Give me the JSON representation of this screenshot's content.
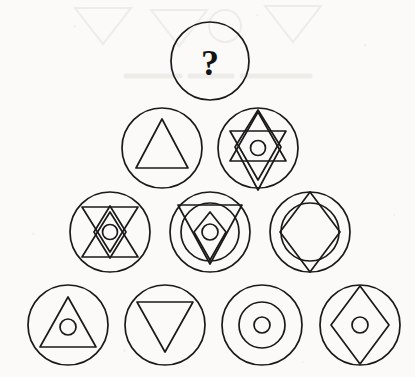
{
  "puzzle": {
    "title": "Shape Pyramid Puzzle",
    "unknown_symbol": "?",
    "stroke_color": "#1a1a1a",
    "background_color": "#fbfaf8",
    "layout": "pyramid",
    "row_counts": [
      1,
      2,
      3,
      4
    ],
    "cell_count": 10
  },
  "cells": [
    {
      "id": "cell-r1-c1",
      "row": 1,
      "col": 1,
      "cx": 210,
      "cy": 61,
      "r": 39,
      "label": "unknown-cell",
      "contents": "question-mark",
      "glyphs": [
        "question-mark"
      ]
    },
    {
      "id": "cell-r2-c1",
      "row": 2,
      "col": 1,
      "cx": 162,
      "cy": 148,
      "r": 40,
      "label": "triangle-up-cell",
      "contents": "upward triangle",
      "glyphs": [
        "triangle-up"
      ]
    },
    {
      "id": "cell-r2-c2",
      "row": 2,
      "col": 2,
      "cx": 258,
      "cy": 148,
      "r": 40,
      "label": "star-diamond-dot-cell",
      "contents": "six-pointed star with tall diamond and small circle",
      "glyphs": [
        "triangle-up",
        "triangle-down",
        "diamond-tall",
        "circle-small"
      ]
    },
    {
      "id": "cell-r3-c1",
      "row": 3,
      "col": 1,
      "cx": 110,
      "cy": 232,
      "r": 40,
      "label": "bowtie-diamond-dot-cell",
      "contents": "hourglass bowtie of two triangles with diamond and small circle",
      "glyphs": [
        "triangle-down",
        "triangle-up",
        "diamond-tall",
        "circle-small"
      ]
    },
    {
      "id": "cell-r3-c2",
      "row": 3,
      "col": 2,
      "cx": 210,
      "cy": 232,
      "r": 40,
      "label": "triangle-down-circle-diamond-dot-cell",
      "contents": "downward triangle over inner circle with diamond and small circle",
      "glyphs": [
        "triangle-down",
        "circle-inner",
        "diamond-tall",
        "circle-small"
      ]
    },
    {
      "id": "cell-r3-c3",
      "row": 3,
      "col": 3,
      "cx": 310,
      "cy": 232,
      "r": 40,
      "label": "diamond-over-circle-cell",
      "contents": "tall diamond overlapping inner circle forming octagon",
      "glyphs": [
        "circle-inner",
        "diamond-tall"
      ]
    },
    {
      "id": "cell-r4-c1",
      "row": 4,
      "col": 1,
      "cx": 68,
      "cy": 325,
      "r": 40,
      "label": "triangle-up-dot-cell",
      "contents": "upward triangle containing a small circle",
      "glyphs": [
        "triangle-up",
        "circle-small"
      ]
    },
    {
      "id": "cell-r4-c2",
      "row": 4,
      "col": 2,
      "cx": 165,
      "cy": 325,
      "r": 40,
      "label": "triangle-down-cell",
      "contents": "downward triangle",
      "glyphs": [
        "triangle-down"
      ]
    },
    {
      "id": "cell-r4-c3",
      "row": 4,
      "col": 3,
      "cx": 262,
      "cy": 325,
      "r": 40,
      "label": "concentric-circles-cell",
      "contents": "inner circle with small circle at centre",
      "glyphs": [
        "circle-inner",
        "circle-small"
      ]
    },
    {
      "id": "cell-r4-c4",
      "row": 4,
      "col": 4,
      "cx": 360,
      "cy": 325,
      "r": 40,
      "label": "diamond-dot-cell",
      "contents": "tall diamond containing a small circle",
      "glyphs": [
        "diamond-tall",
        "circle-small"
      ]
    }
  ]
}
